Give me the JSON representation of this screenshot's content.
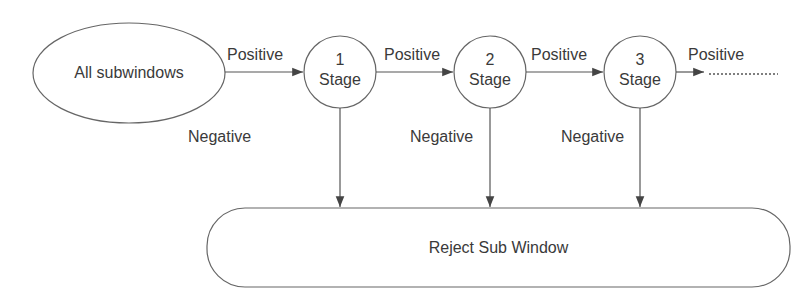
{
  "diagram": {
    "type": "cascade-classifier-flow",
    "start_node": {
      "label": "All subwindows",
      "shape": "ellipse"
    },
    "stages": [
      {
        "number": "1",
        "label": "Stage"
      },
      {
        "number": "2",
        "label": "Stage"
      },
      {
        "number": "3",
        "label": "Stage"
      }
    ],
    "edge_labels": {
      "positive": [
        "Positive",
        "Positive",
        "Positive",
        "Positive"
      ],
      "negative": [
        "Negative",
        "Negative",
        "Negative"
      ]
    },
    "continuation": "dotted-line",
    "reject_node": {
      "label": "Reject Sub Window",
      "shape": "rounded-rectangle"
    },
    "colors": {
      "stroke": "#555555",
      "text": "#3a3a3a",
      "background": "#ffffff"
    }
  }
}
